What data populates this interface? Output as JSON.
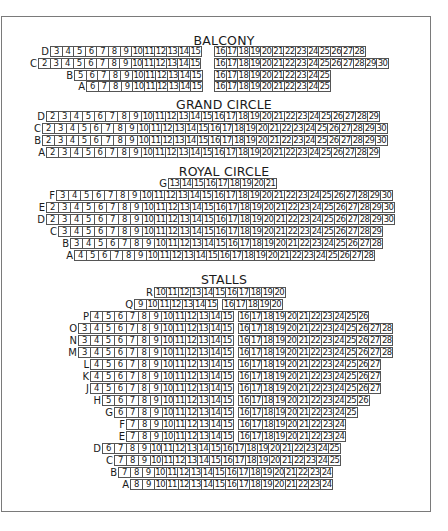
{
  "sections": {
    "balcony": {
      "title": "BALCONY",
      "rows": [
        {
          "label": "D",
          "left": [
            3,
            4,
            5,
            6,
            7,
            8,
            9,
            10,
            11,
            12,
            13,
            14,
            15
          ],
          "right": [
            16,
            17,
            18,
            19,
            20,
            21,
            22,
            23,
            24,
            25,
            26,
            27,
            28
          ]
        },
        {
          "label": "C",
          "left": [
            2,
            3,
            4,
            5,
            6,
            7,
            8,
            9,
            10,
            11,
            12,
            13,
            14,
            15
          ],
          "right": [
            16,
            17,
            18,
            19,
            20,
            21,
            22,
            23,
            24,
            25,
            26,
            27,
            28,
            29,
            30
          ]
        },
        {
          "label": "B",
          "left": [
            5,
            6,
            7,
            8,
            9,
            10,
            11,
            12,
            13,
            14,
            15
          ],
          "right": [
            16,
            17,
            18,
            19,
            20,
            21,
            22,
            23,
            24,
            25
          ]
        },
        {
          "label": "A",
          "left": [
            6,
            7,
            8,
            9,
            10,
            11,
            12,
            13,
            14,
            15
          ],
          "right": [
            16,
            17,
            18,
            19,
            20,
            21,
            22,
            23,
            24,
            25
          ]
        }
      ]
    },
    "grand_circle": {
      "title": "GRAND CIRCLE",
      "rows": [
        {
          "label": "D",
          "seats": [
            2,
            3,
            4,
            5,
            6,
            7,
            8,
            9,
            10,
            11,
            12,
            13,
            14,
            15,
            16,
            17,
            18,
            19,
            20,
            21,
            22,
            23,
            24,
            25,
            26,
            27,
            28,
            29
          ]
        },
        {
          "label": "C",
          "seats": [
            2,
            3,
            4,
            5,
            6,
            7,
            8,
            9,
            10,
            11,
            12,
            13,
            14,
            15,
            16,
            17,
            18,
            19,
            20,
            21,
            22,
            23,
            24,
            25,
            26,
            27,
            28,
            29,
            30
          ]
        },
        {
          "label": "B",
          "seats": [
            2,
            3,
            4,
            5,
            6,
            7,
            8,
            9,
            10,
            11,
            12,
            13,
            14,
            15,
            16,
            17,
            18,
            19,
            20,
            21,
            22,
            23,
            24,
            25,
            26,
            27,
            28,
            29,
            30
          ]
        },
        {
          "label": "A",
          "seats": [
            2,
            3,
            4,
            5,
            6,
            7,
            8,
            9,
            10,
            11,
            12,
            13,
            14,
            15,
            16,
            17,
            18,
            19,
            20,
            21,
            22,
            23,
            24,
            25,
            26,
            27,
            28,
            29
          ]
        }
      ]
    },
    "royal_circle": {
      "title": "ROYAL CIRCLE",
      "rows": [
        {
          "label": "G",
          "seats": [
            13,
            14,
            15,
            16,
            17,
            18,
            19,
            20,
            21
          ]
        },
        {
          "label": "F",
          "seats": [
            3,
            4,
            5,
            6,
            7,
            8,
            9,
            10,
            11,
            12,
            13,
            14,
            15,
            16,
            17,
            18,
            19,
            20,
            21,
            22,
            23,
            24,
            25,
            26,
            27,
            28,
            29,
            30
          ]
        },
        {
          "label": "E",
          "seats": [
            2,
            3,
            4,
            5,
            6,
            7,
            8,
            9,
            10,
            11,
            12,
            13,
            14,
            15,
            16,
            17,
            18,
            19,
            20,
            21,
            22,
            23,
            24,
            25,
            26,
            27,
            28,
            29,
            30
          ]
        },
        {
          "label": "D",
          "seats": [
            2,
            3,
            4,
            5,
            6,
            7,
            8,
            9,
            10,
            11,
            12,
            13,
            14,
            15,
            16,
            17,
            18,
            19,
            20,
            21,
            22,
            23,
            24,
            25,
            26,
            27,
            28,
            29,
            30
          ]
        },
        {
          "label": "C",
          "seats": [
            3,
            4,
            5,
            6,
            7,
            8,
            9,
            10,
            11,
            12,
            13,
            14,
            15,
            16,
            17,
            18,
            19,
            20,
            21,
            22,
            23,
            24,
            25,
            26,
            27,
            28,
            29
          ]
        },
        {
          "label": "B",
          "seats": [
            3,
            4,
            5,
            6,
            7,
            8,
            9,
            10,
            11,
            12,
            13,
            14,
            15,
            16,
            17,
            18,
            19,
            20,
            21,
            22,
            23,
            24,
            25,
            26,
            27,
            28
          ]
        },
        {
          "label": "A",
          "seats": [
            4,
            5,
            6,
            7,
            8,
            9,
            10,
            11,
            12,
            13,
            14,
            15,
            16,
            17,
            18,
            19,
            20,
            21,
            22,
            23,
            24,
            25,
            26,
            27,
            28
          ]
        }
      ]
    },
    "stalls": {
      "title": "STALLS",
      "rows": [
        {
          "label": "R",
          "left": [
            10,
            11,
            12,
            13,
            14,
            15,
            16,
            17,
            18,
            19,
            20
          ],
          "right": []
        },
        {
          "label": "Q",
          "left": [
            9,
            10,
            11,
            12,
            13,
            14,
            15
          ],
          "right": [
            16,
            17,
            18,
            19,
            20
          ]
        },
        {
          "label": "P",
          "left": [
            4,
            5,
            6,
            7,
            8,
            9,
            10,
            11,
            12,
            13,
            14,
            15
          ],
          "right": [
            16,
            17,
            18,
            19,
            20,
            21,
            22,
            23,
            24,
            25,
            26
          ]
        },
        {
          "label": "O",
          "left": [
            3,
            4,
            5,
            6,
            7,
            8,
            9,
            10,
            11,
            12,
            13,
            14,
            15
          ],
          "right": [
            16,
            17,
            18,
            19,
            20,
            21,
            22,
            23,
            24,
            25,
            26,
            27,
            28
          ]
        },
        {
          "label": "N",
          "left": [
            3,
            4,
            5,
            6,
            7,
            8,
            9,
            10,
            11,
            12,
            13,
            14,
            15
          ],
          "right": [
            16,
            17,
            18,
            19,
            20,
            21,
            22,
            23,
            24,
            25,
            26,
            27,
            28
          ]
        },
        {
          "label": "M",
          "left": [
            3,
            4,
            5,
            6,
            7,
            8,
            9,
            10,
            11,
            12,
            13,
            14,
            15
          ],
          "right": [
            16,
            17,
            18,
            19,
            20,
            21,
            22,
            23,
            24,
            25,
            26,
            27,
            28
          ]
        },
        {
          "label": "L",
          "left": [
            4,
            5,
            6,
            7,
            8,
            9,
            10,
            11,
            12,
            13,
            14,
            15
          ],
          "right": [
            16,
            17,
            18,
            19,
            20,
            21,
            22,
            23,
            24,
            25,
            26,
            27
          ]
        },
        {
          "label": "K",
          "left": [
            4,
            5,
            6,
            7,
            8,
            9,
            10,
            11,
            12,
            13,
            14,
            15
          ],
          "right": [
            16,
            17,
            18,
            19,
            20,
            21,
            22,
            23,
            24,
            25,
            26,
            27
          ]
        },
        {
          "label": "J",
          "left": [
            4,
            5,
            6,
            7,
            8,
            9,
            10,
            11,
            12,
            13,
            14,
            15
          ],
          "right": [
            16,
            17,
            18,
            19,
            20,
            21,
            22,
            23,
            24,
            25,
            26,
            27
          ]
        },
        {
          "label": "H",
          "left": [
            5,
            6,
            7,
            8,
            9,
            10,
            11,
            12,
            13,
            14,
            15
          ],
          "right": [
            16,
            17,
            18,
            19,
            20,
            21,
            22,
            23,
            24,
            25,
            26
          ]
        },
        {
          "label": "G",
          "left": [
            6,
            7,
            8,
            9,
            10,
            11,
            12,
            13,
            14,
            15
          ],
          "right": [
            16,
            17,
            18,
            19,
            20,
            21,
            22,
            23,
            24,
            25
          ]
        },
        {
          "label": "F",
          "left": [
            7,
            8,
            9,
            10,
            11,
            12,
            13,
            14,
            15
          ],
          "right": [
            16,
            17,
            18,
            19,
            20,
            21,
            22,
            23,
            24
          ]
        },
        {
          "label": "E",
          "left": [
            7,
            8,
            9,
            10,
            11,
            12,
            13,
            14,
            15
          ],
          "right": [
            16,
            17,
            18,
            19,
            20,
            21,
            22,
            23,
            24
          ]
        },
        {
          "label": "D",
          "left": [
            6,
            7,
            8,
            9,
            10,
            11,
            12,
            13,
            14,
            15,
            16,
            17,
            18,
            19,
            20,
            21,
            22,
            23,
            24,
            25
          ],
          "right": []
        },
        {
          "label": "C",
          "left": [
            7,
            8,
            9,
            10,
            11,
            12,
            13,
            14,
            15,
            16,
            17,
            18,
            19,
            20,
            21,
            22,
            23,
            24,
            25
          ],
          "right": []
        },
        {
          "label": "B",
          "left": [
            7,
            8,
            9,
            10,
            11,
            12,
            13,
            14,
            15,
            16,
            17,
            18,
            19,
            20,
            21,
            22,
            23,
            24
          ],
          "right": []
        },
        {
          "label": "A",
          "left": [
            8,
            9,
            10,
            11,
            12,
            13,
            14,
            15,
            16,
            17,
            18,
            19,
            20,
            21,
            22,
            23,
            24
          ],
          "right": []
        }
      ]
    }
  }
}
